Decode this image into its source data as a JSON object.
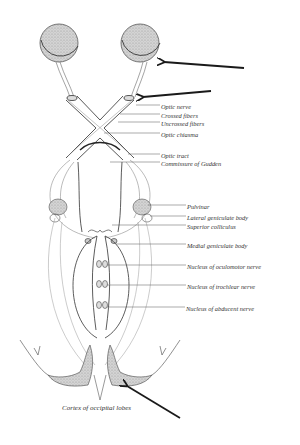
{
  "diagram": {
    "colors": {
      "ink": "#333333",
      "stipple": "#bdbdbd",
      "arrow": "#1a1a1a",
      "background": "#ffffff"
    },
    "labels": [
      {
        "id": "optic-nerve",
        "text": "Optic nerve",
        "x": 161,
        "y": 103
      },
      {
        "id": "crossed-fibers",
        "text": "Crossed fibers",
        "x": 161,
        "y": 112
      },
      {
        "id": "uncrossed-fibers",
        "text": "Uncrossed fibers",
        "x": 161,
        "y": 120
      },
      {
        "id": "optic-chiasma",
        "text": "Optic chiasma",
        "x": 161,
        "y": 131
      },
      {
        "id": "optic-tract",
        "text": "Optic tract",
        "x": 161,
        "y": 152
      },
      {
        "id": "commissure-of-gudden",
        "text": "Commissure of Gudden",
        "x": 161,
        "y": 160
      },
      {
        "id": "pulvinar",
        "text": "Pulvinar",
        "x": 187,
        "y": 203
      },
      {
        "id": "lateral-geniculate-body",
        "text": "Lateral geniculate body",
        "x": 187,
        "y": 214
      },
      {
        "id": "superior-colliculus",
        "text": "Superior colliculus",
        "x": 187,
        "y": 223
      },
      {
        "id": "medial-geniculate-body",
        "text": "Medial geniculate body",
        "x": 187,
        "y": 242
      },
      {
        "id": "nucleus-of-oculomotor-nerve",
        "text": "Nucleus of oculomotor nerve",
        "x": 187,
        "y": 263
      },
      {
        "id": "nucleus-of-trochlear-nerve",
        "text": "Nucleus of trochlear nerve",
        "x": 187,
        "y": 283
      },
      {
        "id": "nucleus-of-abducent-nerve",
        "text": "Nucleus of abducent nerve",
        "x": 186,
        "y": 305
      },
      {
        "id": "cortex-of-occipital-lobes",
        "text": "Cortex of occipital lobes",
        "x": 62,
        "y": 405
      }
    ],
    "arrows": [
      {
        "id": "arrow-eyeball",
        "points_to": "right eyeball",
        "from": [
          244,
          68
        ],
        "to": [
          164,
          62
        ]
      },
      {
        "id": "arrow-optic-nerve",
        "points_to": "right optic nerve stump",
        "from": [
          211,
          91
        ],
        "to": [
          143,
          97
        ]
      },
      {
        "id": "arrow-occipital-cortex",
        "points_to": "right occipital cortex",
        "from": [
          180,
          418
        ],
        "to": [
          127,
          386
        ]
      }
    ]
  }
}
